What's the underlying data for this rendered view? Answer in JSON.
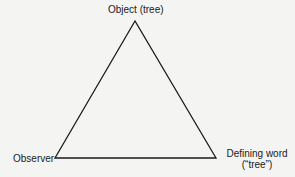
{
  "diagram": {
    "type": "triangle",
    "vertices": {
      "top": {
        "label": "Object (tree)"
      },
      "left": {
        "label": "Observer"
      },
      "right": {
        "line1": "Defining word",
        "line2": "(“tree”)"
      }
    },
    "colors": {
      "background": "#f4f4f2",
      "stroke": "#1a1a1a"
    }
  }
}
